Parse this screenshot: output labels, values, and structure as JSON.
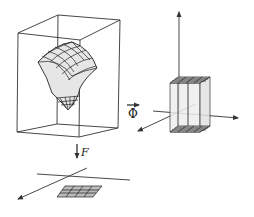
{
  "diagram": {
    "panels": [
      {
        "id": "left-box",
        "content": "wireframe box containing a curved gridded surface patch (cone-like, narrowing to a point at bottom)"
      },
      {
        "id": "right-axes",
        "content": "3D coordinate axes with a rectangular prism having gridded top and bottom faces"
      },
      {
        "id": "bottom-plane",
        "content": "2D coordinate axes with a flat gridded rectangle"
      }
    ],
    "maps": {
      "phi": {
        "label": "Φ",
        "direction": "right",
        "from": "left-box",
        "to": "right-axes"
      },
      "F": {
        "label": "F",
        "direction": "down",
        "from": "left-box",
        "to": "bottom-plane"
      }
    },
    "colors": {
      "stroke": "#333333",
      "surface_fill": "#e6e6e6",
      "prism_fill": "#eeeeee",
      "background": "#ffffff"
    }
  }
}
